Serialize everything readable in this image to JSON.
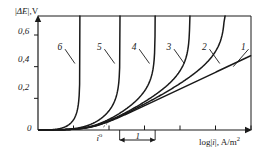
{
  "chart_data": {
    "type": "line",
    "title": "",
    "xlabel": "log|i|, A/m2",
    "xlabel_parts": {
      "log": "log",
      "bar_open": "|",
      "sym": "i",
      "bar_close": "|",
      "comma_unit": ", A/m",
      "exp": "2"
    },
    "ylabel": "|ΔE|,V",
    "ylabel_parts": {
      "bar_open": "|",
      "delta": "Δ",
      "sym": "E",
      "bar_close": "|",
      "comma_unit": ",V"
    },
    "y_ticks": [
      "0",
      "0,2",
      "0,4",
      "0,6"
    ],
    "y_tick_values": [
      0,
      0.2,
      0.4,
      0.6
    ],
    "ylim": [
      0,
      0.72
    ],
    "xlim": [
      0,
      6
    ],
    "x_tick_values": [
      1,
      2,
      3,
      4,
      5,
      6
    ],
    "grid": false,
    "legend_position": "inline-labels",
    "annotations": [
      {
        "name": "exchange-current",
        "text": "i",
        "sup": "o",
        "x": 1.73,
        "y": 0
      },
      {
        "name": "decade-span",
        "text": "1",
        "x_start": 2.3,
        "x_end": 3.3,
        "y": -0.09
      }
    ],
    "series": [
      {
        "name": "1",
        "label": "1",
        "kind": "tafel-line",
        "points": [
          [
            1.55,
            0.0
          ],
          [
            6.0,
            0.47
          ]
        ],
        "label_pos": {
          "x": 5.72,
          "y": 0.52
        },
        "leader_to": {
          "x": 5.5,
          "y": 0.4
        }
      },
      {
        "name": "2",
        "label": "2",
        "kind": "limiting-current",
        "asymptote_x": 5.27,
        "label_pos": {
          "x": 4.62,
          "y": 0.52
        },
        "leader_to": {
          "x": 5.12,
          "y": 0.42
        }
      },
      {
        "name": "3",
        "label": "3",
        "kind": "limiting-current",
        "asymptote_x": 4.28,
        "label_pos": {
          "x": 3.62,
          "y": 0.52
        },
        "leader_to": {
          "x": 4.12,
          "y": 0.42
        }
      },
      {
        "name": "4",
        "label": "4",
        "kind": "limiting-current",
        "asymptote_x": 3.3,
        "label_pos": {
          "x": 2.64,
          "y": 0.52
        },
        "leader_to": {
          "x": 3.14,
          "y": 0.42
        }
      },
      {
        "name": "5",
        "label": "5",
        "kind": "limiting-current",
        "asymptote_x": 2.31,
        "label_pos": {
          "x": 1.66,
          "y": 0.52
        },
        "leader_to": {
          "x": 2.16,
          "y": 0.42
        }
      },
      {
        "name": "6",
        "label": "6",
        "kind": "limiting-current",
        "asymptote_x": 1.18,
        "label_pos": {
          "x": 0.55,
          "y": 0.52
        },
        "leader_to": {
          "x": 1.04,
          "y": 0.42
        }
      }
    ]
  },
  "colors": {
    "ink": "#1a1a1a",
    "background": "#ffffff"
  }
}
